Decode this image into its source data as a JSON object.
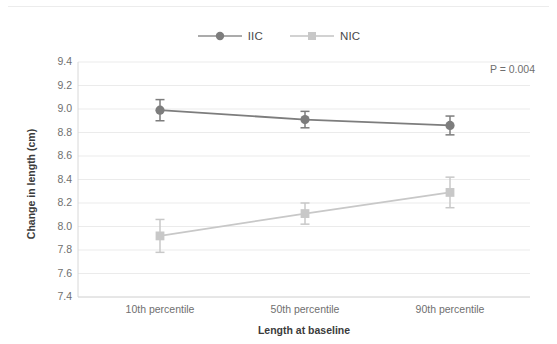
{
  "chart_data": {
    "type": "line",
    "title": "",
    "xlabel": "Length at baseline",
    "ylabel": "Change in length (cm)",
    "categories": [
      "10th percentile",
      "50th percentile",
      "90th percentile"
    ],
    "ylim": [
      7.4,
      9.4
    ],
    "yticks": [
      "9.4",
      "9.2",
      "9.0",
      "8.8",
      "8.6",
      "8.4",
      "8.2",
      "8.0",
      "7.8",
      "7.6",
      "7.4"
    ],
    "grid": true,
    "legend_position": "top-center",
    "annotation": "P = 0.004",
    "series": [
      {
        "name": "IIC",
        "color": "#7d7d7d",
        "marker": "circle",
        "values": [
          8.99,
          8.91,
          8.86
        ],
        "error_low": [
          8.9,
          8.84,
          8.78
        ],
        "error_high": [
          9.08,
          8.98,
          8.94
        ]
      },
      {
        "name": "NIC",
        "color": "#c8c8c8",
        "marker": "square",
        "values": [
          7.92,
          8.11,
          8.29
        ],
        "error_low": [
          7.78,
          8.02,
          8.16
        ],
        "error_high": [
          8.06,
          8.2,
          8.42
        ]
      }
    ]
  },
  "legend": {
    "items": [
      {
        "label": "IIC",
        "color": "#7d7d7d",
        "marker": "circle"
      },
      {
        "label": "NIC",
        "color": "#c8c8c8",
        "marker": "square"
      }
    ]
  },
  "annotation": {
    "pvalue": "P = 0.004"
  },
  "axes": {
    "y_title": "Change in length (cm)",
    "x_title": "Length at baseline"
  }
}
